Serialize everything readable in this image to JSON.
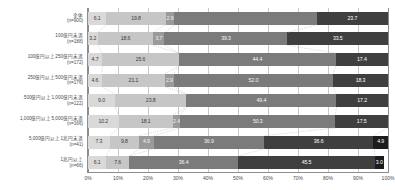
{
  "chart_data": {
    "type": "bar",
    "orientation": "horizontal",
    "stacked": true,
    "stack_mode": "percent",
    "title": "",
    "xlabel": "",
    "ylabel": "",
    "xlim": [
      0,
      100
    ],
    "xticks": [
      "0%",
      "10%",
      "20%",
      "30%",
      "40%",
      "50%",
      "60%",
      "70%",
      "80%",
      "90%",
      "100%"
    ],
    "grid": true,
    "legend": "none",
    "categories": [
      {
        "name": "全体",
        "n": "(n=900)"
      },
      {
        "name": "100億円未満",
        "n": "(n=188)"
      },
      {
        "name": "100億円以上250億円未満",
        "n": "(n=172)"
      },
      {
        "name": "250億円以上500億円未満",
        "n": "(n=176)"
      },
      {
        "name": "500億円以上1,000億円未満",
        "n": "(n=122)"
      },
      {
        "name": "1,000億円以上5,000億円未満",
        "n": "(n=166)"
      },
      {
        "name": "5,000億円以上1兆円未満",
        "n": "(n=41)"
      },
      {
        "name": "1兆円以上",
        "n": "(n=66)"
      }
    ],
    "series": [
      {
        "name": "seg1",
        "color": "#d9d9d9",
        "values": [
          6.1,
          3.2,
          4.7,
          4.6,
          9.0,
          10.2,
          7.3,
          6.1
        ]
      },
      {
        "name": "seg2",
        "color": "#c6c6c6",
        "values": [
          19.8,
          18.6,
          25.6,
          21.1,
          23.8,
          18.1,
          9.8,
          7.6
        ]
      },
      {
        "name": "seg3",
        "color": "#9a9a9a",
        "values": [
          2.9,
          3.7,
          0.0,
          2.9,
          0.0,
          2.4,
          4.9,
          0.0
        ]
      },
      {
        "name": "seg4",
        "color": "#7b7b7b",
        "values": [
          47.5,
          41.0,
          52.3,
          53.1,
          50.0,
          51.8,
          36.9,
          36.4
        ]
      },
      {
        "name": "seg5",
        "color": "#3f3f3f",
        "values": [
          23.7,
          33.5,
          17.4,
          18.3,
          17.2,
          17.5,
          36.6,
          45.5
        ]
      },
      {
        "name": "seg6",
        "color": "#1c1c1c",
        "values": [
          0.0,
          0.0,
          0.0,
          0.0,
          0.0,
          0.0,
          4.9,
          3.0
        ]
      }
    ],
    "data_labels": [
      [
        "6.1",
        "19.8",
        "2.9",
        "",
        "23.7",
        ""
      ],
      [
        "3.2",
        "18.6",
        "3.7",
        "39.3",
        "33.5",
        ""
      ],
      [
        "4.7",
        "25.6",
        "",
        "44.4",
        "17.4",
        ""
      ],
      [
        "4.6",
        "21.1",
        "2.9",
        "52.0",
        "18.3",
        ""
      ],
      [
        "9.0",
        "23.8",
        "",
        "49.4",
        "17.2",
        ""
      ],
      [
        "10.2",
        "18.1",
        "2.4",
        "50.3",
        "17.5",
        ""
      ],
      [
        "7.3",
        "9.8",
        "4.9",
        "36.9",
        "36.6",
        "4.9"
      ],
      [
        "6.1",
        "7.6",
        "",
        "36.4",
        "45.5",
        "3.0"
      ]
    ]
  }
}
